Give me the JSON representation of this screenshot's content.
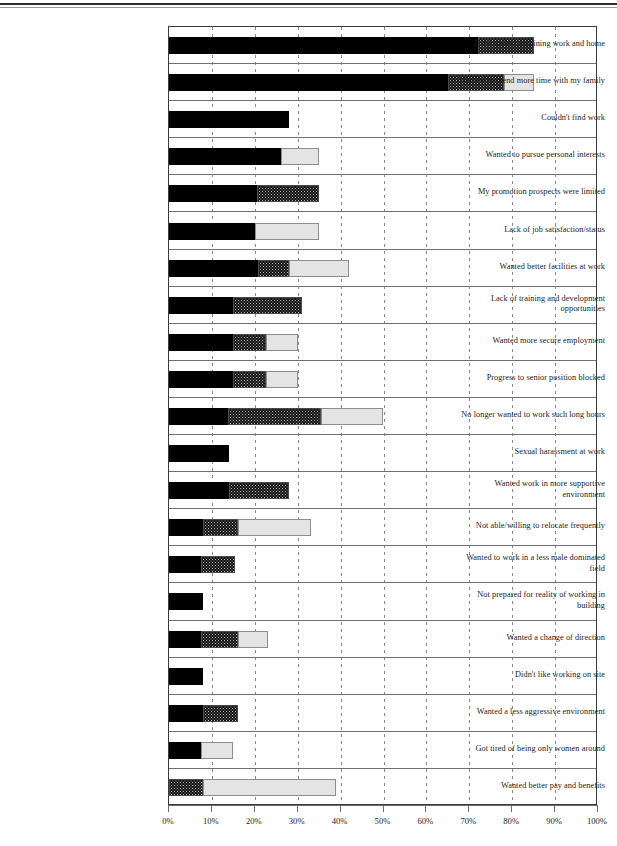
{
  "chart_data": {
    "type": "bar",
    "orientation": "horizontal",
    "stacked": true,
    "title": "",
    "xlabel": "",
    "ylabel": "",
    "xlim": [
      0,
      100
    ],
    "xticks": [
      "0%",
      "10%",
      "20%",
      "30%",
      "40%",
      "50%",
      "60%",
      "70%",
      "80%",
      "90%",
      "100%"
    ],
    "xtick_values": [
      0,
      10,
      20,
      30,
      40,
      50,
      60,
      70,
      80,
      90,
      100
    ],
    "grid": true,
    "legend": "none",
    "series": [
      {
        "name": "series-1",
        "style": "solid-black",
        "color": "#000000"
      },
      {
        "name": "series-2",
        "style": "hatched-grey",
        "color": "#b9b9b9"
      },
      {
        "name": "series-3",
        "style": "light-grey",
        "color": "#e4e4e4"
      }
    ],
    "categories": [
      "Difficulties combining work and home",
      "Wanted to spend more time with my family",
      "Couldn't find work",
      "Wanted to pursue personal interests",
      "My promotion prospects were limited",
      "Lack of job satisfaction/status",
      "Wanted better facilities at work",
      "Lack of training and development opportunities",
      "Wanted more secure employment",
      "Progress to senior position blocked",
      "No longer wanted to work such long hours",
      "Sexual harassment at work",
      "Wanted work in more supportive environment",
      "Not able/willing to relocate frequently",
      "Wanted to work in a less male dominated field",
      "Not prepared for reality of working in building",
      "Wanted a change of direction",
      "Didn't like working on site",
      "Wanted a less aggressive environment",
      "Got tired of being only women around",
      "Wanted better pay and benefits"
    ],
    "values": [
      [
        72,
        13,
        0
      ],
      [
        65,
        13,
        7
      ],
      [
        28,
        0,
        0
      ],
      [
        26,
        0,
        9
      ],
      [
        20.5,
        14.5,
        0
      ],
      [
        20,
        0,
        15
      ],
      [
        20.7,
        7.3,
        14
      ],
      [
        15,
        16,
        0
      ],
      [
        15,
        7.5,
        7.5
      ],
      [
        15,
        7.5,
        7.5
      ],
      [
        13.7,
        21.8,
        14.5
      ],
      [
        14,
        0,
        0
      ],
      [
        14,
        14,
        0
      ],
      [
        8,
        8,
        17
      ],
      [
        7.5,
        8,
        0
      ],
      [
        8,
        0,
        0
      ],
      [
        7.5,
        8.5,
        7
      ],
      [
        8,
        0,
        0
      ],
      [
        8,
        8,
        0
      ],
      [
        7.5,
        0,
        7.5
      ],
      [
        0,
        8,
        31
      ]
    ]
  }
}
